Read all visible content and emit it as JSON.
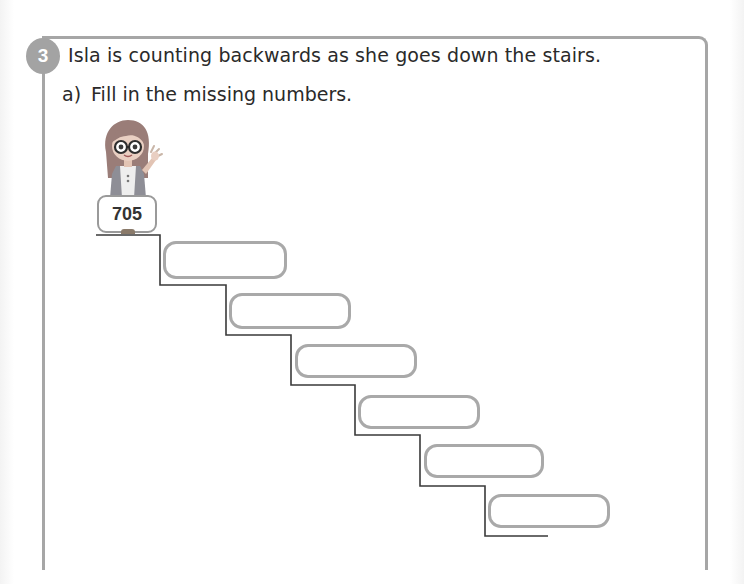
{
  "question": {
    "number": "3",
    "text": "Isla is counting backwards as she goes down the stairs.",
    "parts": [
      {
        "label": "a)",
        "text": "Fill in the missing numbers."
      }
    ]
  },
  "character": {
    "name": "Isla",
    "icon": "girl-with-glasses-waving-icon"
  },
  "staircase": {
    "start_value": "705",
    "answer_boxes": [
      {
        "value": "",
        "placeholder": ""
      },
      {
        "value": "",
        "placeholder": ""
      },
      {
        "value": "",
        "placeholder": ""
      },
      {
        "value": "",
        "placeholder": ""
      },
      {
        "value": "",
        "placeholder": ""
      },
      {
        "value": "",
        "placeholder": ""
      }
    ]
  },
  "colors": {
    "frame": "#a6a6a6",
    "badge": "#a3a3a3",
    "box_border": "#a9a9a9",
    "stair_line": "#3a3a3a"
  }
}
